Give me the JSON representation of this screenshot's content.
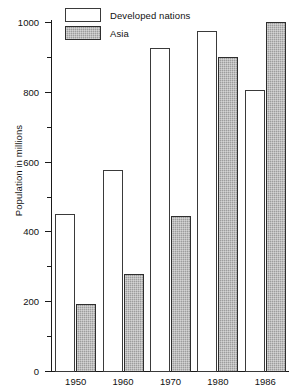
{
  "chart_data": {
    "type": "bar",
    "title": "",
    "subtitle": "",
    "xlabel": "",
    "ylabel": "Population in millions",
    "categories": [
      "1950",
      "1960",
      "1970",
      "1980",
      "1986"
    ],
    "series": [
      {
        "name": "Developed nations",
        "values": [
          450,
          575,
          925,
          975,
          805
        ],
        "style": "open-white"
      },
      {
        "name": "Asia",
        "values": [
          193,
          277,
          443,
          900,
          1000
        ],
        "style": "gray-hatched"
      }
    ],
    "ylim": [
      0,
      1000
    ],
    "y_major_ticks": [
      0,
      200,
      400,
      600,
      800,
      1000
    ],
    "y_major_tick_labels": [
      "0",
      "200",
      "400",
      "600",
      "800",
      "1000"
    ],
    "y_minor_ticks": [
      100,
      300,
      500,
      700,
      900
    ],
    "grid": false,
    "legend_position": "top-left",
    "legend_entries": [
      "Developed nations",
      "Asia"
    ]
  },
  "axes": {
    "y_title": "Population in millions"
  },
  "legend": {
    "items": [
      {
        "label": "Developed nations"
      },
      {
        "label": "Asia"
      }
    ]
  },
  "colors": {
    "developed_fill": "#ffffff",
    "asia_fill": "#9d9d9d",
    "outline": "#3a3a3a",
    "axis": "#1a1a1a",
    "text": "#111111",
    "background": "#ffffff"
  }
}
